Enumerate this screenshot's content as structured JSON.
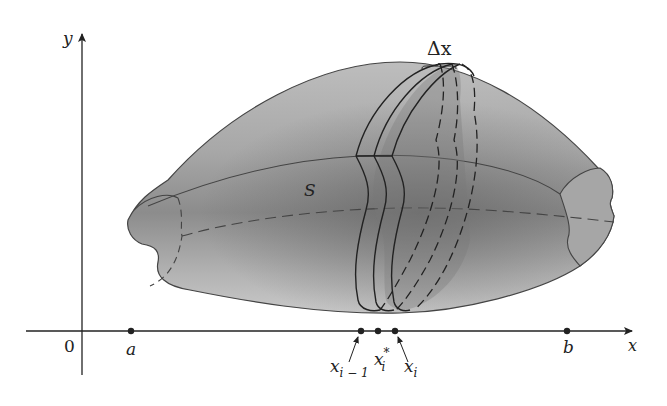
{
  "figure": {
    "type": "solid-of-revolution-slicing"
  },
  "axes": {
    "x_label": "x",
    "y_label": "y",
    "origin_label": "0"
  },
  "solid": {
    "label": "S",
    "fill_colors": {
      "light": "#c4c4c4",
      "mid": "#9e9e9e",
      "dark": "#6e6e6e",
      "slab": "#8a8a8a"
    }
  },
  "points": {
    "a": "a",
    "b": "b",
    "x_im1_base": "x",
    "x_im1_sub": "i − 1",
    "x_star_base": "x",
    "x_star_sub": "i",
    "x_star_sup": "*",
    "x_i_base": "x",
    "x_i_sub": "i"
  },
  "slab": {
    "width_label": "Δx"
  }
}
